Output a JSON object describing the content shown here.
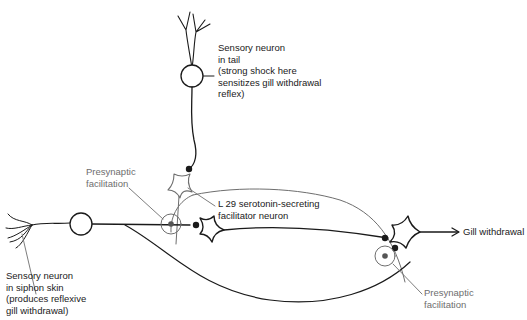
{
  "diagram": {
    "labels": {
      "tail_sensory": "Sensory neuron\nin tail\n(strong shock here\nsensitizes gill withdrawal\nreflex)",
      "l29": "L 29 serotonin-secreting\nfacilitator neuron",
      "presyn_left": "Presynaptic\nfacilitation",
      "presyn_right": "Presynaptic\nfacilitation",
      "gill_output": "Gill withdrawal",
      "siphon_sensory": "Sensory neuron\nin siphon skin\n(produces reflexive\ngill withdrawal)"
    },
    "colors": {
      "neuron_stroke": "#1a1a1a",
      "facilitator_stroke": "#6e6e6e",
      "label_text": "#1a1a1a",
      "annotation_text": "#6e6e6e",
      "background": "#ffffff"
    }
  }
}
